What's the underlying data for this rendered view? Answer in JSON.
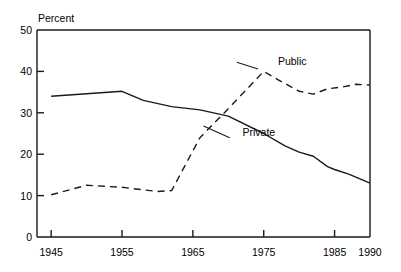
{
  "chart_data": {
    "type": "line",
    "title": "",
    "ylabel": "Percent",
    "xlabel": "",
    "xlim": [
      1943,
      1990
    ],
    "ylim": [
      0,
      50
    ],
    "grid": false,
    "legend_position": "inline-annotation",
    "yticks": [
      "0",
      "10",
      "20",
      "30",
      "40",
      "50"
    ],
    "ytick_values": [
      0,
      10,
      20,
      30,
      40,
      50
    ],
    "xticks": [
      "1945",
      "1955",
      "1965",
      "1975",
      "1985",
      "1990"
    ],
    "xtick_values": [
      1945,
      1955,
      1965,
      1975,
      1985,
      1990
    ],
    "series": [
      {
        "name": "Private",
        "style": "solid",
        "color": "#1a1a1a",
        "label_x": 1972,
        "label_y": 24.5,
        "x": [
          1945,
          1950,
          1955,
          1958,
          1962,
          1966,
          1970,
          1975,
          1978,
          1980,
          1982,
          1984,
          1985,
          1987,
          1990
        ],
        "values": [
          34.0,
          34.6,
          35.2,
          33.0,
          31.5,
          30.7,
          29.2,
          25.0,
          22.0,
          20.5,
          19.5,
          17.0,
          16.3,
          15.2,
          13.0
        ]
      },
      {
        "name": "Public",
        "style": "dashed",
        "color": "#1a1a1a",
        "label_x": 1977,
        "label_y": 41.5,
        "x": [
          1945,
          1950,
          1955,
          1960,
          1962,
          1966,
          1970,
          1975,
          1977,
          1980,
          1982,
          1984,
          1986,
          1988,
          1990
        ],
        "values": [
          10.2,
          12.5,
          12.0,
          11.0,
          11.2,
          24.0,
          31.0,
          40.0,
          38.0,
          35.2,
          34.5,
          35.8,
          36.2,
          36.9,
          36.7
        ]
      }
    ]
  },
  "annotations": {
    "public_label": "Public",
    "private_label": "Private",
    "percent_label": "Percent"
  }
}
